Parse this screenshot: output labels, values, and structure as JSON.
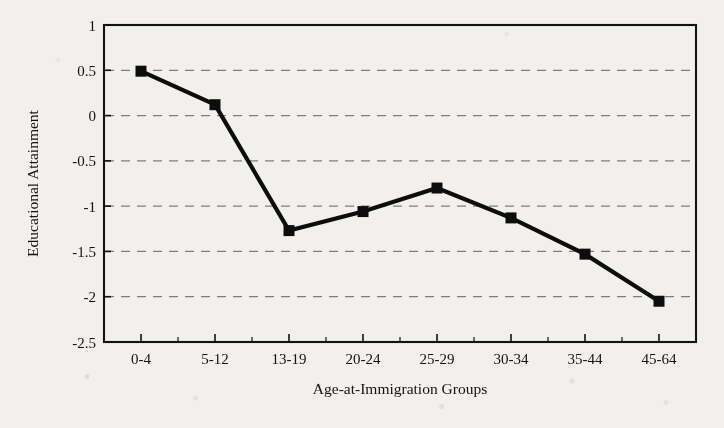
{
  "chart_data": {
    "type": "line",
    "title": "",
    "xlabel": "Age-at-Immigration Groups",
    "ylabel": "Educational Attainment",
    "categories": [
      "0-4",
      "5-12",
      "13-19",
      "20-24",
      "25-29",
      "30-34",
      "35-44",
      "45-64"
    ],
    "values": [
      0.49,
      0.12,
      -1.27,
      -1.06,
      -0.8,
      -1.13,
      -1.53,
      -2.05
    ],
    "series": [
      {
        "name": "Educational Attainment",
        "values": [
          0.49,
          0.12,
          -1.27,
          -1.06,
          -0.8,
          -1.13,
          -1.53,
          -2.05
        ]
      }
    ],
    "ylim": [
      -2.5,
      1
    ],
    "yticks": [
      1,
      0.5,
      0,
      -0.5,
      -1,
      -1.5,
      -2,
      -2.5
    ],
    "ytick_labels": [
      "1",
      "0.5",
      "0",
      "-0.5",
      "-1",
      "-1.5",
      "-2",
      "-2.5"
    ],
    "grid": "horizontal-dashed",
    "legend": "none",
    "marker": "square",
    "line_color": "#0d0d0d",
    "grid_color": "#7d7d7d",
    "frame_color": "#121212",
    "background_color": "#f2f0ec"
  }
}
